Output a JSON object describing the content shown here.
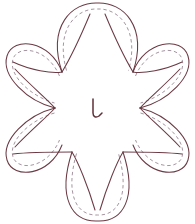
{
  "document": {
    "title": "Flower Applique Pattern",
    "type": "line-art-template",
    "background_color": "#ffffff",
    "width": 195,
    "height": 224
  },
  "style": {
    "outline_color": "#6b3a44",
    "dashed_color": "#9b8893",
    "center_mark_color": "#5e3038",
    "outline_width": 1.05,
    "dashed_width": 0.9,
    "dash_pattern": "3.4 2.8"
  },
  "flower": {
    "name": "six-petal-flower",
    "petal_count": 6,
    "center": {
      "x": 97.5,
      "y": 108
    },
    "center_mark": {
      "name": "hook-mark",
      "glyph": "L",
      "x": 97,
      "y": 110
    },
    "petals": [
      {
        "id": "petal-top",
        "label": "Top petal",
        "angle_deg": -90,
        "tip": {
          "x": 97.5,
          "y": 3
        },
        "base_left": {
          "x": 62,
          "y": 72
        },
        "base_right": {
          "x": 133,
          "y": 72
        }
      },
      {
        "id": "petal-upper-right",
        "label": "Upper right petal",
        "angle_deg": -30,
        "tip": {
          "x": 188,
          "y": 56
        },
        "base_left": {
          "x": 133,
          "y": 72
        },
        "base_right": {
          "x": 140,
          "y": 108
        }
      },
      {
        "id": "petal-lower-right",
        "label": "Lower right petal",
        "angle_deg": 30,
        "tip": {
          "x": 188,
          "y": 160
        },
        "base_left": {
          "x": 140,
          "y": 108
        },
        "base_right": {
          "x": 123,
          "y": 152
        }
      },
      {
        "id": "petal-bottom",
        "label": "Bottom petal",
        "angle_deg": 90,
        "tip": {
          "x": 97.5,
          "y": 221
        },
        "base_left": {
          "x": 123,
          "y": 152
        },
        "base_right": {
          "x": 72,
          "y": 152
        }
      },
      {
        "id": "petal-lower-left",
        "label": "Lower left petal",
        "angle_deg": 150,
        "tip": {
          "x": 7,
          "y": 160
        },
        "base_left": {
          "x": 72,
          "y": 152
        },
        "base_right": {
          "x": 55,
          "y": 108
        }
      },
      {
        "id": "petal-upper-left",
        "label": "Upper left petal",
        "angle_deg": -150,
        "tip": {
          "x": 7,
          "y": 56
        },
        "base_left": {
          "x": 55,
          "y": 108
        },
        "base_right": {
          "x": 62,
          "y": 72
        }
      }
    ]
  }
}
